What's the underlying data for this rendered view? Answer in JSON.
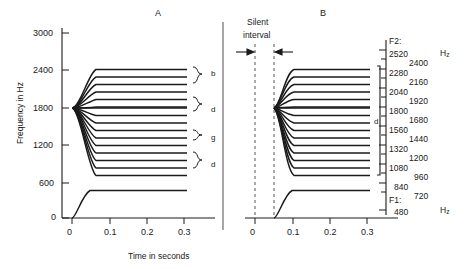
{
  "chart_data": {
    "type": "line",
    "title": "",
    "xlabel": "Time in seconds",
    "ylabel": "Frequency in Hz",
    "xlim": [
      -0.035,
      0.345
    ],
    "ylim": [
      0,
      3200
    ],
    "xticks": [
      "0",
      "0.1",
      "0.2",
      "0.3"
    ],
    "xtick_values": [
      0,
      0.1,
      0.2,
      0.3
    ],
    "yticks": [
      "0",
      "600",
      "1200",
      "1800",
      "2400",
      "3000"
    ],
    "ytick_values": [
      0,
      600,
      1200,
      1800,
      2400,
      3000
    ],
    "grid": false,
    "legend": null,
    "panels": [
      {
        "label": "A",
        "description": "Two-formant patterns with F2 transitions all originating from a common locus at 1800 Hz",
        "f1_steady_hz": 480,
        "f1_onset_hz": 0,
        "f1_transition_end_s": 0.055,
        "f2_locus_hz": 1800,
        "f2_locus_time_s": 0.0,
        "f2_transition_end_s": 0.06,
        "f2_steady_values": [
          2520,
          2400,
          2280,
          2160,
          2040,
          1920,
          1800,
          1680,
          1560,
          1440,
          1320,
          1200,
          1080,
          960,
          840,
          720
        ],
        "steady_end_s": 0.3,
        "braces": [
          {
            "label": "b",
            "from_hz": 2520,
            "to_hz": 2040
          },
          {
            "label": "d",
            "from_hz": 1920,
            "to_hz": 1560
          },
          {
            "label": "g",
            "from_hz": 1440,
            "to_hz": 1320
          },
          {
            "label": "d",
            "from_hz": 1200,
            "to_hz": 720
          }
        ]
      },
      {
        "label": "B",
        "description": "Same F2 transitions preceded by a silent interval; all stimuli heard as d",
        "f1_steady_hz": 480,
        "f1_onset_hz": 0,
        "f1_onset_time_s": 0.05,
        "f1_transition_end_s": 0.105,
        "f2_locus_hz": 1800,
        "f2_locus_time_s": 0.05,
        "f2_transition_end_s": 0.11,
        "f2_steady_values": [
          2520,
          2400,
          2280,
          2160,
          2040,
          1920,
          1800,
          1680,
          1560,
          1440,
          1320,
          1200,
          1080,
          960,
          840,
          720
        ],
        "steady_end_s": 0.3,
        "silent_interval": {
          "label_line1": "Silent",
          "label_line2": "interval",
          "start_s": 0.0,
          "end_s": 0.05
        },
        "braces": [
          {
            "label": "d",
            "from_hz": 2520,
            "to_hz": 720
          }
        ]
      }
    ],
    "right_scale": {
      "f2_header": "F2:",
      "f1_header": "F1:",
      "hz_top": "Hz",
      "hz_bottom": "Hz",
      "column_left": [
        "2520",
        "2280",
        "2040",
        "1800",
        "1560",
        "1320",
        "1080",
        "840"
      ],
      "column_right": [
        "2400",
        "2160",
        "1920",
        "1680",
        "1440",
        "1200",
        "960",
        "720"
      ],
      "f1_value": "480",
      "all_values": [
        2520,
        2400,
        2280,
        2160,
        2040,
        1920,
        1800,
        1680,
        1560,
        1440,
        1320,
        1200,
        1080,
        960,
        840,
        720,
        480
      ]
    }
  },
  "axes": {
    "y_title": "Frequency in Hz",
    "x_title": "Time in seconds"
  },
  "panel_a": {
    "letter": "A"
  },
  "panel_b": {
    "letter": "B"
  },
  "colors": {
    "ink": "#1a1a1a",
    "background": "#ffffff"
  }
}
